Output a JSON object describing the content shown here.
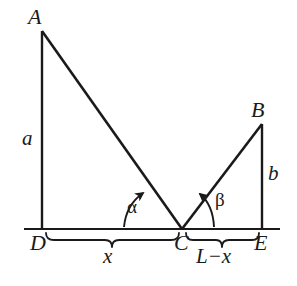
{
  "figure": {
    "type": "geometry-diagram",
    "background_color": "#ffffff",
    "stroke_color": "#1a1a1a",
    "text_color": "#1a1a1a"
  },
  "points": {
    "A": {
      "label": "A",
      "x": 42,
      "y": 31,
      "label_x": 28,
      "label_y": 6
    },
    "B": {
      "label": "B",
      "x": 262,
      "y": 124,
      "label_x": 251,
      "label_y": 99
    },
    "C": {
      "label": "C",
      "x": 182,
      "y": 229,
      "label_x": 174,
      "label_y": 232
    },
    "D": {
      "label": "D",
      "x": 42,
      "y": 229,
      "label_x": 30,
      "label_y": 232
    },
    "E": {
      "label": "E",
      "x": 262,
      "y": 229,
      "label_x": 254,
      "label_y": 232
    }
  },
  "segments": {
    "baseline": {
      "name": "DE-baseline",
      "x1": 24,
      "y1": 229,
      "x2": 280,
      "y2": 229
    },
    "AD": {
      "name": "A-to-D-vertical",
      "x1": 42,
      "y1": 31,
      "x2": 42,
      "y2": 229
    },
    "AC": {
      "name": "A-to-C-incident",
      "x1": 42,
      "y1": 31,
      "x2": 182,
      "y2": 229
    },
    "CB": {
      "name": "C-to-B-reflected",
      "x1": 182,
      "y1": 229,
      "x2": 262,
      "y2": 124
    },
    "BE": {
      "name": "B-to-E-vertical",
      "x1": 262,
      "y1": 124,
      "x2": 262,
      "y2": 229
    }
  },
  "side_labels": {
    "a": {
      "text": "a",
      "x": 22,
      "y": 128,
      "describes": "length AD"
    },
    "b": {
      "text": "b",
      "x": 268,
      "y": 163,
      "describes": "length BE"
    }
  },
  "angle_labels": {
    "alpha": {
      "text": "α",
      "x": 127,
      "y": 197,
      "describes": "angle at C between baseline DC and CA"
    },
    "beta": {
      "text": "β",
      "x": 215,
      "y": 190,
      "describes": "angle at C between baseline CE and CB"
    }
  },
  "braces": {
    "left": {
      "label": "x",
      "from": "D",
      "to": "C",
      "x1": 46,
      "x2": 179,
      "label_x": 103,
      "label_y": 246
    },
    "right": {
      "label": "L−x",
      "from": "C",
      "to": "E",
      "x1": 186,
      "x2": 259,
      "label_x": 196,
      "label_y": 246
    }
  }
}
